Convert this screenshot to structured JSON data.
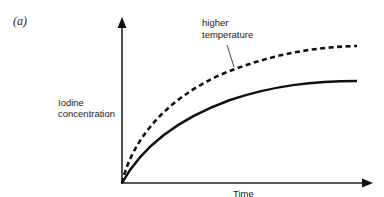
{
  "figure": {
    "panel_label": "(a)",
    "y_axis_label_line1": "Iodine",
    "y_axis_label_line2": "concentration",
    "x_axis_label": "Time",
    "annotation_line1": "higher",
    "annotation_line2": "temperature"
  },
  "curves": [
    {
      "name": "higher temperature",
      "style": "dashed",
      "color": "#111111"
    },
    {
      "name": "lower temperature",
      "style": "solid",
      "color": "#111111"
    }
  ]
}
